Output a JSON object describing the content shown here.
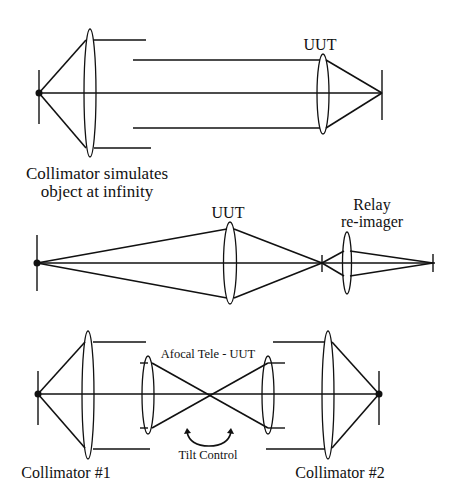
{
  "diagrams": {
    "top": {
      "lens_label": "UUT",
      "caption_line1": "Collimator simulates",
      "caption_line2": "object at infinity"
    },
    "middle": {
      "lens_label": "UUT",
      "relay_label_line1": "Relay",
      "relay_label_line2": "re-imager"
    },
    "bottom": {
      "afocal_label": "Afocal Tele - UUT",
      "tilt_label": "Tilt Control",
      "collimator1_label": "Collimator #1",
      "collimator2_label": "Collimator #2"
    }
  },
  "icons": {
    "tilt_arrow": "double-headed-arc-arrow"
  },
  "colors": {
    "line": "#111111",
    "background": "#ffffff"
  }
}
